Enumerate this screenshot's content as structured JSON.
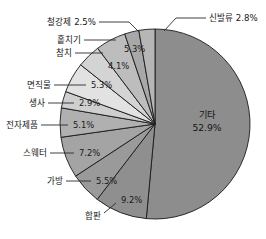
{
  "chart_data": {
    "type": "pie",
    "title": "",
    "subtitle": "",
    "xlabel": "",
    "ylabel": "",
    "legend_position": "none",
    "grid": false,
    "units": "percent",
    "start_angle_deg": 0,
    "direction": "clockwise",
    "categories": [
      "기타",
      "합판",
      "가방",
      "스웨터",
      "전자제품",
      "생사",
      "면직물",
      "참치",
      "홑치기",
      "철강제",
      "신발류"
    ],
    "values": [
      52.9,
      9.2,
      5.5,
      7.2,
      5.1,
      2.9,
      5.3,
      4.1,
      5.3,
      2.5,
      2.8
    ],
    "slices": [
      {
        "label": "기타",
        "value": 52.9,
        "value_text": "52.9%",
        "color": "#8d8d8d",
        "label_placement": "inside",
        "show_name": true
      },
      {
        "label": "합판",
        "value": 9.2,
        "value_text": "9.2%",
        "color": "#8f8f8f",
        "label_placement": "outside",
        "show_name": true
      },
      {
        "label": "가방",
        "value": 5.5,
        "value_text": "5.5%",
        "color": "#9a9a9a",
        "label_placement": "outside",
        "show_name": true
      },
      {
        "label": "스웨터",
        "value": 7.2,
        "value_text": "7.2%",
        "color": "#a4a4a4",
        "label_placement": "outside",
        "show_name": true
      },
      {
        "label": "전자제품",
        "value": 5.1,
        "value_text": "5.1%",
        "color": "#b0b0b0",
        "label_placement": "outside",
        "show_name": true
      },
      {
        "label": "생사",
        "value": 2.9,
        "value_text": "2.9%",
        "color": "#cfcfcf",
        "label_placement": "outside",
        "show_name": true
      },
      {
        "label": "면직물",
        "value": 5.3,
        "value_text": "5.3%",
        "color": "#e2e2e2",
        "label_placement": "outside",
        "show_name": true
      },
      {
        "label": "참치",
        "value": 4.1,
        "value_text": "4.1%",
        "color": "#d4d4d4",
        "label_placement": "outside",
        "show_name": true
      },
      {
        "label": "홑치기",
        "value": 5.3,
        "value_text": "5.3%",
        "color": "#bdbdbd",
        "label_placement": "outside",
        "show_name": true
      },
      {
        "label": "철강제",
        "value": 2.5,
        "value_text": "2.5%",
        "color": "#a8a8a8",
        "label_placement": "outside",
        "show_name": true
      },
      {
        "label": "신발류",
        "value": 2.8,
        "value_text": "2.8%",
        "color": "#b6b6b6",
        "label_placement": "outside",
        "show_name": true
      }
    ]
  },
  "labels": {
    "sinbalryu": "신발류 2.8%",
    "cheolgangje": "철강제 2.5%",
    "hotchigi": "홑치기",
    "chamchi": "참치",
    "myeonjikmul": "면직물",
    "saengsa": "생사",
    "jeonjajepum": "전자제품",
    "seuweteo": "스웨터",
    "gabang": "가방",
    "hapan": "합판",
    "gita_name": "기타",
    "gita_pct": "52.9%",
    "pct_hotchigi": "5.3%",
    "pct_chamchi": "4.1%",
    "pct_myeonjikmul": "5.3%",
    "pct_saengsa": "2.9%",
    "pct_jeonjajepum": "5.1%",
    "pct_seuweteo": "7.2%",
    "pct_gabang": "5.5%",
    "pct_hapan": "9.2%"
  },
  "colors": {
    "outline": "#1a1a1a",
    "text": "#171717",
    "background": "#ffffff"
  }
}
